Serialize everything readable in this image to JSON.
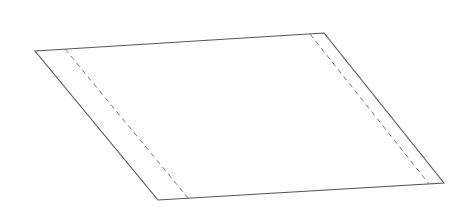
{
  "diagram": {
    "colors": {
      "outline": "#555555",
      "fold_line": "#777777",
      "background": "#ffffff",
      "fill": "#ffffff"
    },
    "outline": {
      "points": [
        [
          35,
          51
        ],
        [
          324,
          33
        ],
        [
          444,
          183
        ],
        [
          158,
          200
        ]
      ]
    },
    "fold_lines": [
      {
        "name": "left-fold",
        "x1": 65,
        "y1": 49,
        "x2": 188,
        "y2": 198
      },
      {
        "name": "right-fold",
        "x1": 310,
        "y1": 34,
        "x2": 429,
        "y2": 184
      }
    ]
  }
}
